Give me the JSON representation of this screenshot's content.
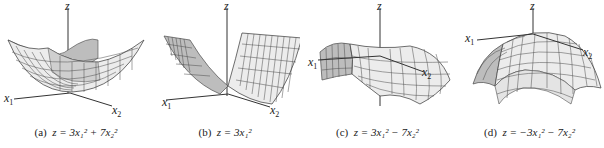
{
  "figure": {
    "panels": [
      {
        "id": "a",
        "tag": "(a)",
        "equation": "z = 3x₁² + 7x₂²",
        "shape": "elliptic paraboloid (bowl, opens up)",
        "axes": {
          "z": "z",
          "x1": "x",
          "x1_sub": "1",
          "x2": "x",
          "x2_sub": "2"
        }
      },
      {
        "id": "b",
        "tag": "(b)",
        "equation": "z = 3x₁²",
        "shape": "parabolic cylinder (trough)",
        "axes": {
          "z": "z",
          "x1": "x",
          "x1_sub": "1",
          "x2": "x",
          "x2_sub": "2"
        }
      },
      {
        "id": "c",
        "tag": "(c)",
        "equation": "z = 3x₁² − 7x₂²",
        "shape": "hyperbolic paraboloid (saddle)",
        "axes": {
          "z": "z",
          "x1": "x",
          "x1_sub": "1",
          "x2": "x",
          "x2_sub": "2"
        }
      },
      {
        "id": "d",
        "tag": "(d)",
        "equation": "z = −3x₁² − 7x₂²",
        "shape": "elliptic paraboloid (dome, opens down)",
        "axes": {
          "z": "z",
          "x1": "x",
          "x1_sub": "1",
          "x2": "x",
          "x2_sub": "2"
        }
      }
    ]
  },
  "colors": {
    "surface_front": "#ececec",
    "surface_back": "#bdbdbd",
    "grid": "#4a4a4a",
    "axis": "#333333",
    "text": "#222222"
  }
}
